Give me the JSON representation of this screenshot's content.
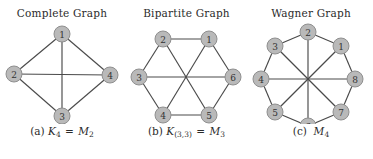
{
  "figure": {
    "background": "#ffffff",
    "node_fill": "#b9b9b9",
    "node_stroke": "#8f8f8f",
    "edge_color": "#4a4a4a",
    "label_color": "#333333",
    "panels": [
      {
        "id": "complete-graph",
        "title": "Complete Graph",
        "caption_prefix": "(a)",
        "caption_symbol": "K",
        "caption_symbol_sub": "4",
        "caption_eq": "=",
        "caption_symbol2": "M",
        "caption_symbol2_sub": "2",
        "node_labels": [
          "1",
          "2",
          "3",
          "4"
        ],
        "nodes": [
          {
            "label": "1",
            "x": 62,
            "y": 14
          },
          {
            "label": "2",
            "x": 14,
            "y": 54
          },
          {
            "label": "3",
            "x": 62,
            "y": 96
          },
          {
            "label": "4",
            "x": 110,
            "y": 55
          }
        ],
        "edges": [
          [
            "1",
            "2"
          ],
          [
            "1",
            "3"
          ],
          [
            "1",
            "4"
          ],
          [
            "2",
            "3"
          ],
          [
            "2",
            "4"
          ],
          [
            "3",
            "4"
          ]
        ]
      },
      {
        "id": "bipartite-graph",
        "title": "Bipartite Graph",
        "caption_prefix": "(b)",
        "caption_symbol": "K",
        "caption_symbol_sub": "(3,3)",
        "caption_eq": "=",
        "caption_symbol2": "M",
        "caption_symbol2_sub": "3",
        "node_labels": [
          "1",
          "2",
          "3",
          "4",
          "5",
          "6"
        ],
        "nodes": [
          {
            "label": "1",
            "x": 84,
            "y": 19
          },
          {
            "label": "2",
            "x": 38,
            "y": 19
          },
          {
            "label": "3",
            "x": 14,
            "y": 57
          },
          {
            "label": "4",
            "x": 38,
            "y": 95
          },
          {
            "label": "5",
            "x": 84,
            "y": 95
          },
          {
            "label": "6",
            "x": 108,
            "y": 57
          }
        ],
        "edges": [
          [
            "1",
            "2"
          ],
          [
            "2",
            "3"
          ],
          [
            "3",
            "4"
          ],
          [
            "4",
            "5"
          ],
          [
            "5",
            "6"
          ],
          [
            "6",
            "1"
          ],
          [
            "1",
            "4"
          ],
          [
            "2",
            "5"
          ],
          [
            "3",
            "6"
          ]
        ]
      },
      {
        "id": "wagner-graph",
        "title": "Wagner Graph",
        "caption_prefix": "(c)",
        "caption_symbol": "M",
        "caption_symbol_sub": "4",
        "caption_eq": "",
        "caption_symbol2": "",
        "caption_symbol2_sub": "",
        "node_labels": [
          "1",
          "2",
          "3",
          "4",
          "5",
          "6",
          "7",
          "8"
        ],
        "nodes": [
          {
            "label": "2",
            "x": 59,
            "y": 12
          },
          {
            "label": "1",
            "x": 92,
            "y": 26
          },
          {
            "label": "8",
            "x": 106,
            "y": 59
          },
          {
            "label": "7",
            "x": 92,
            "y": 92
          },
          {
            "label": "6",
            "x": 59,
            "y": 106
          },
          {
            "label": "5",
            "x": 26,
            "y": 92
          },
          {
            "label": "4",
            "x": 12,
            "y": 59
          },
          {
            "label": "3",
            "x": 26,
            "y": 26
          }
        ],
        "edges": [
          [
            "1",
            "2"
          ],
          [
            "2",
            "3"
          ],
          [
            "3",
            "4"
          ],
          [
            "4",
            "5"
          ],
          [
            "5",
            "6"
          ],
          [
            "6",
            "7"
          ],
          [
            "7",
            "8"
          ],
          [
            "8",
            "1"
          ],
          [
            "1",
            "5"
          ],
          [
            "2",
            "6"
          ],
          [
            "3",
            "7"
          ],
          [
            "4",
            "8"
          ]
        ]
      }
    ]
  }
}
